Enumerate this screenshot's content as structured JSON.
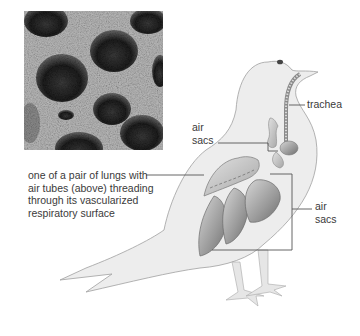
{
  "figure": {
    "micrograph": {
      "description": "scanning electron micrograph of lung tissue with air tube openings"
    },
    "illustration": {
      "subject": "bird (pigeon) respiratory system"
    },
    "labels": {
      "trachea": "trachea",
      "air_sacs_top": [
        "air",
        "sacs"
      ],
      "air_sacs_right": [
        "air",
        "sacs"
      ],
      "lung": [
        "one of a pair of lungs with",
        "air tubes (above) threading",
        "through its vascularized",
        "respiratory surface"
      ]
    },
    "colors": {
      "bird_fill": "#ececec",
      "bird_outline": "#9a9a9a",
      "organ_dark": "#8c8c8c",
      "organ_light": "#d4d4d4",
      "leader_line": "#555555",
      "text": "#3a3a3a"
    }
  }
}
